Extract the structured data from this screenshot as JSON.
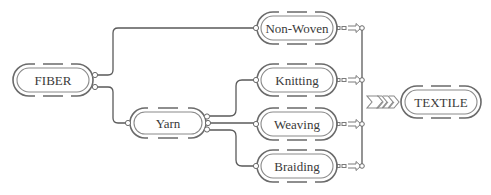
{
  "diagram": {
    "type": "flow",
    "colors": {
      "stroke": "#5a5a5a",
      "text": "#3a3a3a",
      "background": "#ffffff"
    },
    "nodes": [
      {
        "id": "fiber",
        "label": "FIBER",
        "cx": 53,
        "cy": 80,
        "w": 78,
        "h": 31
      },
      {
        "id": "yarn",
        "label": "Yarn",
        "cx": 168,
        "cy": 123,
        "w": 76,
        "h": 30
      },
      {
        "id": "nonwoven",
        "label": "Non-Woven",
        "cx": 297,
        "cy": 28,
        "w": 78,
        "h": 31
      },
      {
        "id": "knitting",
        "label": "Knitting",
        "cx": 297,
        "cy": 80,
        "w": 78,
        "h": 31
      },
      {
        "id": "weaving",
        "label": "Weaving",
        "cx": 297,
        "cy": 124,
        "w": 78,
        "h": 31
      },
      {
        "id": "braiding",
        "label": "Braiding",
        "cx": 297,
        "cy": 166,
        "w": 78,
        "h": 31
      },
      {
        "id": "textile",
        "label": "TEXTILE",
        "cx": 441,
        "cy": 102,
        "w": 78,
        "h": 31
      }
    ],
    "edges": [
      {
        "from": "fiber",
        "to": "nonwoven"
      },
      {
        "from": "fiber",
        "to": "yarn"
      },
      {
        "from": "yarn",
        "to": "knitting"
      },
      {
        "from": "yarn",
        "to": "weaving"
      },
      {
        "from": "yarn",
        "to": "braiding"
      },
      {
        "from": "nonwoven",
        "to": "textile"
      },
      {
        "from": "knitting",
        "to": "textile"
      },
      {
        "from": "weaving",
        "to": "textile"
      },
      {
        "from": "braiding",
        "to": "textile"
      }
    ],
    "merge_symbol": "chevron-arrows"
  }
}
